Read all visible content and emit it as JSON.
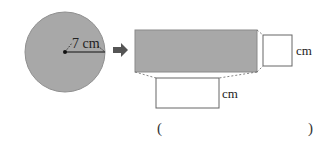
{
  "figure": {
    "circle": {
      "radius_label": "7 cm",
      "fill_color": "#a8a8a8"
    },
    "arrow": {
      "icon": "right-arrow-icon",
      "color": "#555555"
    },
    "rectangle": {
      "fill_color": "#a8a8a8"
    },
    "side_box": {
      "value": "",
      "unit_label": "cm"
    },
    "bottom_box": {
      "value": "",
      "unit_label": "cm"
    }
  },
  "answer": {
    "open_paren": "(",
    "close_paren": ")",
    "value": ""
  }
}
